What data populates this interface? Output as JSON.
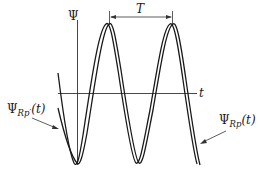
{
  "diagram": {
    "type": "waveform",
    "axes": {
      "vertical_label": "Ψ",
      "horizontal_label": "t"
    },
    "period_label": "T",
    "curves": [
      {
        "name": "Psi_Rp_prime",
        "label_main": "Ψ",
        "label_sub": "Rp′",
        "label_arg": "(t)",
        "style": "solid"
      },
      {
        "name": "Psi_Rp",
        "label_main": "Ψ",
        "label_sub": "Rp",
        "label_arg": "(t)",
        "style": "solid"
      }
    ],
    "colors": {
      "stroke": "#1a1a1a",
      "background": "#ffffff"
    }
  }
}
